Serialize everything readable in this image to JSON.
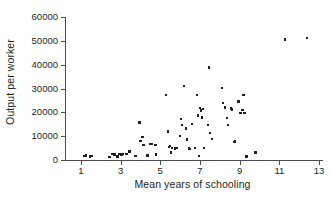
{
  "chart_data": {
    "type": "scatter",
    "title": "",
    "xlabel": "Mean years of schooling",
    "ylabel": "Output per worker",
    "xlim": [
      0.2,
      13.2
    ],
    "ylim": [
      0,
      60000
    ],
    "grid": false,
    "legend": null,
    "xticks": [
      1,
      3,
      5,
      7,
      9,
      11,
      13
    ],
    "xticklabels": [
      "1",
      "3",
      "5",
      "7",
      "9",
      "11",
      "13"
    ],
    "yticks": [
      0,
      10000,
      20000,
      30000,
      40000,
      50000,
      60000
    ],
    "yticklabels": [
      "0",
      "10000",
      "20000",
      "30000",
      "40000",
      "50000",
      "60000"
    ],
    "marker": "square",
    "marker_color": "#231f20",
    "axis_color": "#4d4d4f",
    "points": [
      {
        "x": 1.15,
        "y": 1700
      },
      {
        "x": 1.25,
        "y": 1900
      },
      {
        "x": 1.45,
        "y": 1500
      },
      {
        "x": 1.55,
        "y": 1800
      },
      {
        "x": 2.45,
        "y": 1300
      },
      {
        "x": 2.6,
        "y": 2600
      },
      {
        "x": 2.7,
        "y": 2300
      },
      {
        "x": 2.85,
        "y": 1500
      },
      {
        "x": 2.95,
        "y": 2500
      },
      {
        "x": 3.0,
        "y": 2600
      },
      {
        "x": 3.05,
        "y": 2300
      },
      {
        "x": 3.1,
        "y": 2500
      },
      {
        "x": 3.3,
        "y": 2400
      },
      {
        "x": 3.45,
        "y": 3600
      },
      {
        "x": 3.75,
        "y": 1600
      },
      {
        "x": 3.95,
        "y": 15800
      },
      {
        "x": 4.0,
        "y": 8000
      },
      {
        "x": 4.1,
        "y": 9700
      },
      {
        "x": 4.15,
        "y": 6400
      },
      {
        "x": 4.35,
        "y": 1900
      },
      {
        "x": 4.5,
        "y": 6800
      },
      {
        "x": 4.55,
        "y": 6600
      },
      {
        "x": 4.75,
        "y": 6300
      },
      {
        "x": 4.8,
        "y": 2300
      },
      {
        "x": 5.3,
        "y": 27300
      },
      {
        "x": 5.4,
        "y": 12000
      },
      {
        "x": 5.45,
        "y": 5500
      },
      {
        "x": 5.5,
        "y": 6000
      },
      {
        "x": 5.55,
        "y": 3200
      },
      {
        "x": 5.6,
        "y": 5100
      },
      {
        "x": 5.75,
        "y": 4900
      },
      {
        "x": 5.85,
        "y": 5000
      },
      {
        "x": 6.0,
        "y": 10200
      },
      {
        "x": 6.05,
        "y": 17300
      },
      {
        "x": 6.1,
        "y": 14600
      },
      {
        "x": 6.2,
        "y": 31000
      },
      {
        "x": 6.3,
        "y": 13300
      },
      {
        "x": 6.35,
        "y": 8600
      },
      {
        "x": 6.45,
        "y": 4800
      },
      {
        "x": 6.5,
        "y": 4600
      },
      {
        "x": 6.6,
        "y": 15000
      },
      {
        "x": 6.75,
        "y": 5000
      },
      {
        "x": 6.85,
        "y": 27400
      },
      {
        "x": 6.9,
        "y": 18700
      },
      {
        "x": 6.95,
        "y": 1600
      },
      {
        "x": 7.0,
        "y": 21800
      },
      {
        "x": 7.05,
        "y": 20800
      },
      {
        "x": 7.1,
        "y": 17900
      },
      {
        "x": 7.15,
        "y": 21300
      },
      {
        "x": 7.2,
        "y": 5000
      },
      {
        "x": 7.4,
        "y": 14800
      },
      {
        "x": 7.45,
        "y": 38800
      },
      {
        "x": 7.5,
        "y": 11400
      },
      {
        "x": 7.6,
        "y": 8700
      },
      {
        "x": 8.1,
        "y": 30100
      },
      {
        "x": 8.15,
        "y": 23900
      },
      {
        "x": 8.25,
        "y": 22100
      },
      {
        "x": 8.35,
        "y": 17700
      },
      {
        "x": 8.4,
        "y": 14800
      },
      {
        "x": 8.55,
        "y": 21600
      },
      {
        "x": 8.6,
        "y": 21200
      },
      {
        "x": 8.75,
        "y": 7600
      },
      {
        "x": 8.78,
        "y": 8100
      },
      {
        "x": 8.95,
        "y": 24500
      },
      {
        "x": 9.05,
        "y": 19800
      },
      {
        "x": 9.15,
        "y": 21000
      },
      {
        "x": 9.2,
        "y": 27400
      },
      {
        "x": 9.25,
        "y": 19700
      },
      {
        "x": 9.35,
        "y": 1500
      },
      {
        "x": 9.8,
        "y": 3200
      },
      {
        "x": 11.3,
        "y": 50600
      },
      {
        "x": 12.4,
        "y": 51200
      }
    ]
  }
}
